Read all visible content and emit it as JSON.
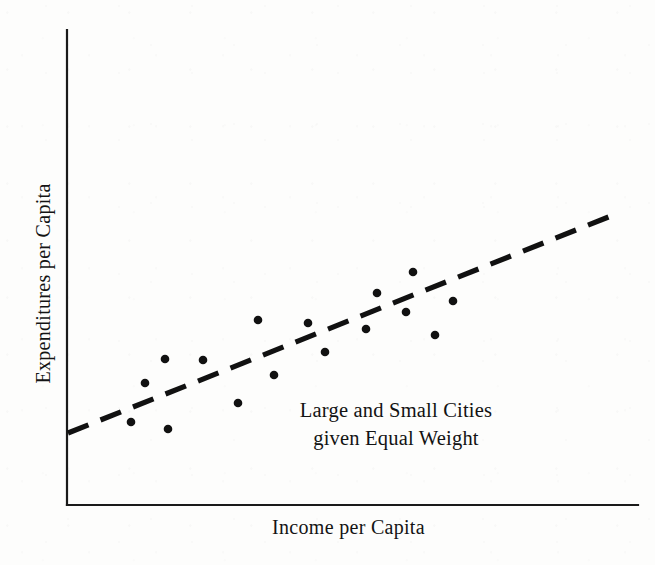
{
  "figure": {
    "background_color": "#fdfdfc",
    "ink_color": "#111111"
  },
  "annotation": {
    "line1": "Large and Small Cities",
    "line2": "given Equal Weight"
  },
  "chart_data": {
    "type": "scatter",
    "title": "",
    "xlabel": "Income per Capita",
    "ylabel": "Expenditures per Capita",
    "grid": false,
    "legend": "none",
    "axes": {
      "x_ticks": [],
      "y_ticks": [],
      "x_axis_line": {
        "x1": 67,
        "y1": 505,
        "x2": 638,
        "y2": 505
      },
      "y_axis_line": {
        "x1": 67,
        "y1": 30,
        "x2": 67,
        "y2": 505
      },
      "axis_color": "#1a1a1a",
      "axis_width": 2.2
    },
    "annotations": [
      {
        "text": "Large and Small Cities",
        "x": 396,
        "y": 416
      },
      {
        "text": "given Equal Weight",
        "x": 396,
        "y": 444
      }
    ],
    "series": [
      {
        "name": "cities",
        "marker": "filled-circle",
        "marker_color": "#111111",
        "marker_radius": 4.3,
        "points": [
          {
            "x": 131,
            "y": 422
          },
          {
            "x": 145,
            "y": 383
          },
          {
            "x": 165,
            "y": 359
          },
          {
            "x": 168,
            "y": 429
          },
          {
            "x": 203,
            "y": 360
          },
          {
            "x": 238,
            "y": 403
          },
          {
            "x": 258,
            "y": 320
          },
          {
            "x": 274,
            "y": 375
          },
          {
            "x": 308,
            "y": 323
          },
          {
            "x": 325,
            "y": 352
          },
          {
            "x": 366,
            "y": 329
          },
          {
            "x": 377,
            "y": 293
          },
          {
            "x": 406,
            "y": 312
          },
          {
            "x": 413,
            "y": 272
          },
          {
            "x": 435,
            "y": 335
          },
          {
            "x": 453,
            "y": 301
          }
        ]
      }
    ],
    "trend_line": {
      "name": "fitted-regression-line",
      "style": "dashed",
      "color": "#111111",
      "width": 5.2,
      "dash_length": 22,
      "gap_length": 13,
      "x1": 68,
      "y1": 433,
      "x2": 616,
      "y2": 214
    }
  }
}
